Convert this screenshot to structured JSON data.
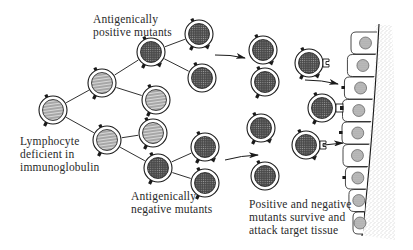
{
  "diagram": {
    "type": "biological schematic",
    "colors": {
      "ink": "#1a1a1a",
      "stripe_fill": "#9a9a9a",
      "dark_fill": "#3a3a3a",
      "tissue_stipple": "#b0b0b0",
      "background": "#ffffff"
    }
  },
  "labels": {
    "positive_mutants": "Antigenically\npositive mutants",
    "origin": "Lymphocyte\ndeficient in\nimmunoglobulin",
    "negative_mutants": "Antigenically\nnegative mutants",
    "outcome": "Positive and negative\nmutants survive and\nattack target tissue"
  },
  "nodes": [
    {
      "id": "origin",
      "kind": "striped",
      "x": 53,
      "y": 110
    },
    {
      "id": "gen1-upper",
      "kind": "striped",
      "x": 102,
      "y": 83
    },
    {
      "id": "gen1-lower",
      "kind": "striped",
      "x": 107,
      "y": 140
    },
    {
      "id": "gen2-positive",
      "kind": "dark",
      "x": 151,
      "y": 52
    },
    {
      "id": "gen2-upper-striped",
      "kind": "striped",
      "x": 156,
      "y": 100
    },
    {
      "id": "gen2-lower-striped",
      "kind": "striped",
      "x": 153,
      "y": 133
    },
    {
      "id": "gen2-negative",
      "kind": "dark",
      "x": 158,
      "y": 168
    },
    {
      "id": "gen3-pos-a",
      "kind": "dark",
      "x": 199,
      "y": 34
    },
    {
      "id": "gen3-pos-b",
      "kind": "dark",
      "x": 202,
      "y": 78
    },
    {
      "id": "gen3-neg-a",
      "kind": "dark",
      "x": 205,
      "y": 147
    },
    {
      "id": "gen3-neg-b",
      "kind": "dark",
      "x": 205,
      "y": 183
    },
    {
      "id": "survivor-1",
      "kind": "dark",
      "x": 263,
      "y": 50
    },
    {
      "id": "survivor-2",
      "kind": "dark",
      "x": 265,
      "y": 82
    },
    {
      "id": "survivor-3",
      "kind": "dark",
      "x": 261,
      "y": 128
    },
    {
      "id": "survivor-4",
      "kind": "dark",
      "x": 265,
      "y": 176
    },
    {
      "id": "attacker-1",
      "kind": "dark",
      "x": 309,
      "y": 63
    },
    {
      "id": "attacker-2",
      "kind": "dark",
      "x": 322,
      "y": 108
    },
    {
      "id": "attacker-3",
      "kind": "dark",
      "x": 306,
      "y": 145
    }
  ],
  "edges": [
    [
      "origin",
      "gen1-upper"
    ],
    [
      "origin",
      "gen1-lower"
    ],
    [
      "gen1-upper",
      "gen2-positive"
    ],
    [
      "gen1-upper",
      "gen2-upper-striped"
    ],
    [
      "gen1-lower",
      "gen2-lower-striped"
    ],
    [
      "gen1-lower",
      "gen2-negative"
    ],
    [
      "gen2-positive",
      "gen3-pos-a"
    ],
    [
      "gen2-positive",
      "gen3-pos-b"
    ],
    [
      "gen2-negative",
      "gen3-neg-a"
    ],
    [
      "gen2-negative",
      "gen3-neg-b"
    ]
  ],
  "arrows": [
    {
      "from": [
        215,
        55
      ],
      "to": [
        245,
        58
      ]
    },
    {
      "from": [
        305,
        80
      ],
      "to": [
        338,
        84
      ]
    },
    {
      "from": [
        225,
        160
      ],
      "to": [
        258,
        155
      ]
    },
    {
      "from": [
        305,
        149
      ],
      "to": [
        343,
        143
      ]
    }
  ],
  "tissue": {
    "cell_count": 9,
    "label": "target tissue"
  }
}
